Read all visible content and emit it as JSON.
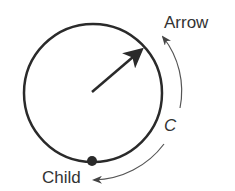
{
  "diagram": {
    "labels": {
      "arrow": "Arrow",
      "child": "Child",
      "curve": "C"
    },
    "colors": {
      "stroke": "#2a2a2a",
      "thin_stroke": "#555555",
      "text": "#333333",
      "background": "#ffffff"
    },
    "circle": {
      "cx": 93,
      "cy": 93,
      "r": 69
    },
    "pointer_arrow": {
      "from": [
        92,
        92
      ],
      "to": [
        142,
        49
      ]
    },
    "child_dot": {
      "cx": 92,
      "cy": 161,
      "r": 5
    }
  }
}
